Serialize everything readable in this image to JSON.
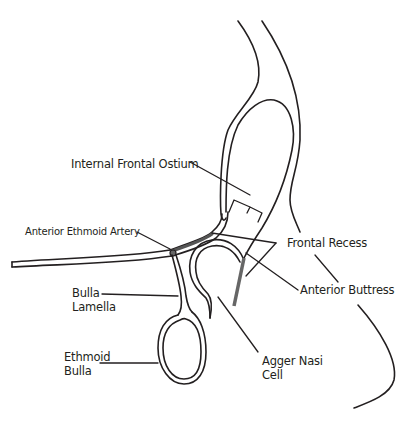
{
  "diagram": {
    "type": "anatomical-line-drawing",
    "colors": {
      "line": "#231f20",
      "highlight": "#555555",
      "background": "#ffffff"
    },
    "labels": {
      "internal_frontal_ostium": "Internal Frontal Ostium",
      "anterior_ethmoid_artery": "Anterior Ethmoid Artery",
      "frontal_recess": "Frontal Recess",
      "bulla_lamella_line1": "Bulla",
      "bulla_lamella_line2": "Lamella",
      "anterior_buttress": "Anterior Buttress",
      "ethmoid_bulla_line1": "Ethmoid",
      "ethmoid_bulla_line2": "Bulla",
      "agger_nasi_line1": "Agger Nasi",
      "agger_nasi_line2": "Cell"
    }
  }
}
